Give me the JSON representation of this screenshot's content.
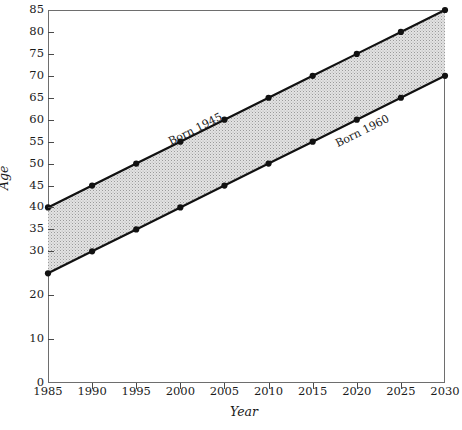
{
  "chart_data": {
    "type": "line",
    "title": "",
    "xlabel": "Year",
    "ylabel": "Age",
    "xlim": [
      1985,
      2030
    ],
    "ylim": [
      0,
      85
    ],
    "grid": false,
    "legend_position": "inline-annotation",
    "fill_between": true,
    "fill_color": "#d6d6d6",
    "line_color": "#111111",
    "marker": "filled-circle",
    "x": [
      1985,
      1990,
      1995,
      2000,
      2005,
      2010,
      2015,
      2020,
      2025,
      2030
    ],
    "xticks": [
      "1985",
      "1990",
      "1995",
      "2000",
      "2005",
      "2010",
      "2015",
      "2020",
      "2025",
      "2030"
    ],
    "yticks": [
      "0",
      "10",
      "20",
      "30",
      "35",
      "40",
      "45",
      "50",
      "55",
      "60",
      "65",
      "70",
      "75",
      "80",
      "85"
    ],
    "ytick_values": [
      0,
      10,
      20,
      30,
      35,
      40,
      45,
      50,
      55,
      60,
      65,
      70,
      75,
      80,
      85
    ],
    "series": [
      {
        "name": "Born 1945",
        "label": "Born 1945",
        "values": [
          40,
          45,
          50,
          55,
          60,
          65,
          70,
          75,
          80,
          85
        ]
      },
      {
        "name": "Born 1960",
        "label": "Born 1960",
        "values": [
          25,
          30,
          35,
          40,
          45,
          50,
          55,
          60,
          65,
          70
        ]
      }
    ],
    "annotations": [
      {
        "text": "Born 1945",
        "x": 1999.0,
        "y": 56.5
      },
      {
        "text": "Born 1960",
        "x": 2018.0,
        "y": 56.0
      }
    ]
  }
}
